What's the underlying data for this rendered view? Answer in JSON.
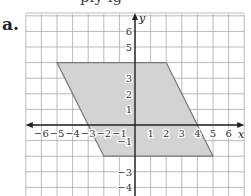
{
  "part_label": "a.",
  "cut_text": "ply    ig",
  "graph": {
    "x_axis_label": "x",
    "y_axis_label": "y",
    "x_ticks": [
      "−6",
      "−5",
      "−4",
      "−3",
      "−2",
      "−1",
      "1",
      "2",
      "3",
      "4",
      "5",
      "6"
    ],
    "y_ticks": [
      "6",
      "5",
      "3",
      "2",
      "1",
      "−1",
      "−3",
      "−4"
    ],
    "shape": {
      "type": "parallelogram",
      "vertices": [
        [
          -5,
          4
        ],
        [
          2,
          4
        ],
        [
          5,
          -2
        ],
        [
          -2,
          -2
        ]
      ],
      "fill": "#d3d3d3",
      "stroke": "#777777"
    },
    "grid_color": "#aaaaaa",
    "axis_color": "#222222"
  }
}
